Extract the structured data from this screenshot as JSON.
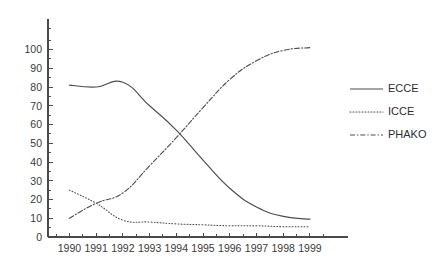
{
  "chart_data": {
    "type": "line",
    "title": "",
    "subtitle": "",
    "xlabel": "",
    "ylabel": "",
    "grid": false,
    "legend_position": "right",
    "x": [
      1990,
      1991,
      1992,
      1993,
      1994,
      1995,
      1996,
      1997,
      1998,
      1999
    ],
    "categories": [
      "1990",
      "1991",
      "1992",
      "1993",
      "1994",
      "1995",
      "1996",
      "1997",
      "1998",
      "1999"
    ],
    "xlim": [
      1989.2,
      1999.9
    ],
    "ylim": [
      0,
      112
    ],
    "y_ticks": [
      0,
      10,
      20,
      30,
      40,
      50,
      60,
      70,
      80,
      90,
      100
    ],
    "y_tick_labels": [
      "0",
      "10",
      "20",
      "30",
      "40",
      "50",
      "60",
      "70",
      "80",
      "90",
      "100"
    ],
    "y_minor_ticks": [
      5,
      15,
      25,
      35,
      45,
      55,
      65,
      75,
      85,
      95,
      105,
      111
    ],
    "x_ticks": [
      1990,
      1991,
      1992,
      1993,
      1994,
      1995,
      1996,
      1997,
      1998,
      1999
    ],
    "x_minor_ticks": [
      1989.5,
      1990.5,
      1991.5,
      1992.5,
      1993.5,
      1994.5,
      1995.5,
      1996.5,
      1997.5,
      1998.5,
      1999.5
    ],
    "series": [
      {
        "name": "ECCE",
        "style": "solid",
        "color": "#4d4d4d",
        "values": [
          81,
          80,
          82.5,
          70,
          57,
          41,
          26,
          16,
          11,
          9.5
        ]
      },
      {
        "name": "ICCE",
        "style": "dotted",
        "color": "#4d4d4d",
        "values": [
          25,
          18,
          9,
          8,
          7,
          6.5,
          6,
          6,
          5.5,
          5.5
        ]
      },
      {
        "name": "PHAKO",
        "style": "dashdot",
        "color": "#4d4d4d",
        "values": [
          10,
          18,
          23.5,
          38,
          53,
          69,
          84,
          94,
          99.5,
          101
        ]
      }
    ],
    "annotations": [
      {
        "text": "ECCE and PHAKO cross near 1994 at about 55%"
      },
      {
        "text": "ICCE and PHAKO cross near 1991 at about 18%"
      }
    ]
  },
  "legend": {
    "entries": [
      {
        "label": "ECCE",
        "style": "solid"
      },
      {
        "label": "ICCE",
        "style": "dotted"
      },
      {
        "label": "PHAKO",
        "style": "dashdot"
      }
    ]
  },
  "colors": {
    "background": "#ffffff",
    "axis": "#4a4a4a",
    "text": "#3a3a3a",
    "line": "#4d4d4d"
  }
}
